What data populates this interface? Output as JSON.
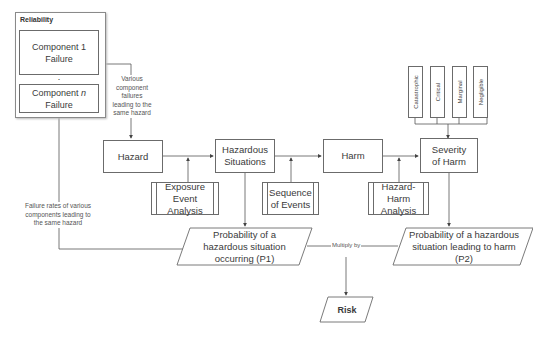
{
  "reliability": {
    "title": "Reliability",
    "component_1": "Component 1 Failure",
    "component_n": "Component n Failure",
    "ellipsis": "⋮"
  },
  "notes": {
    "various_failures": "Various component failures leading to the same hazard",
    "failure_rates": "Failure rates of various components leading to the same hazard",
    "multiply_by": "Multiply by"
  },
  "chain": {
    "hazard": "Hazard",
    "hazardous_situations": "Hazardous Situations",
    "harm": "Harm",
    "severity_of_harm": "Severity of Harm"
  },
  "analyses": {
    "exposure": "Exposure Event Analysis",
    "sequence": "Sequence of Events",
    "hazard_harm": "Hazard-Harm Analysis"
  },
  "severity_levels": [
    "Catastrophic",
    "Critical",
    "Marginal",
    "Negligible"
  ],
  "probabilities": {
    "p1": "Probability of a hazardous situation occurring (P1)",
    "p2": "Probability of a hazardous situation leading to harm (P2)"
  },
  "risk": "Risk",
  "colors": {
    "line": "#555555",
    "border": "#6b6b6b",
    "text": "#3a3a3a"
  }
}
